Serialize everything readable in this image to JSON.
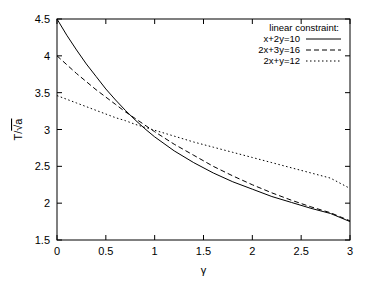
{
  "chart_data": {
    "type": "line",
    "title": "",
    "subtitle": "",
    "xlabel": "γ",
    "ylabel": "T/√a",
    "xlim": [
      0,
      3
    ],
    "ylim": [
      1.5,
      4.5
    ],
    "grid": false,
    "legend_position": "top-right",
    "legend_title": "linear constraint:",
    "xticks": [
      "0",
      "0.5",
      "1",
      "1.5",
      "2",
      "2.5",
      "3"
    ],
    "xtick_values": [
      0,
      0.5,
      1,
      1.5,
      2,
      2.5,
      3
    ],
    "yticks": [
      "1.5",
      "2",
      "2.5",
      "3",
      "3.5",
      "4",
      "4.5"
    ],
    "ytick_values": [
      1.5,
      2,
      2.5,
      3,
      3.5,
      4,
      4.5
    ],
    "x": [
      0,
      0.1,
      0.2,
      0.3,
      0.4,
      0.5,
      0.6,
      0.7,
      0.8,
      0.9,
      1.0,
      1.2,
      1.4,
      1.6,
      1.8,
      2.0,
      2.2,
      2.4,
      2.6,
      2.8,
      3.0
    ],
    "series": [
      {
        "name": "x+2y=10",
        "dash": "solid",
        "color": "#000000",
        "values": [
          4.5,
          4.28,
          4.08,
          3.89,
          3.72,
          3.55,
          3.4,
          3.26,
          3.13,
          3.01,
          2.9,
          2.71,
          2.55,
          2.41,
          2.29,
          2.19,
          2.09,
          2.01,
          1.93,
          1.86,
          1.75
        ]
      },
      {
        "name": "2x+3y=16",
        "dash": "dashed",
        "color": "#000000",
        "values": [
          4.0,
          3.88,
          3.76,
          3.65,
          3.54,
          3.44,
          3.34,
          3.24,
          3.15,
          3.06,
          2.97,
          2.8,
          2.65,
          2.5,
          2.37,
          2.25,
          2.14,
          2.04,
          1.95,
          1.87,
          1.76
        ]
      },
      {
        "name": "2x+y=12",
        "dash": "dotted",
        "color": "#000000",
        "values": [
          3.46,
          3.41,
          3.36,
          3.31,
          3.26,
          3.21,
          3.16,
          3.12,
          3.07,
          3.03,
          2.99,
          2.91,
          2.83,
          2.76,
          2.69,
          2.62,
          2.55,
          2.48,
          2.41,
          2.34,
          2.2
        ]
      }
    ]
  },
  "axes": {
    "frame_color": "#000000"
  }
}
